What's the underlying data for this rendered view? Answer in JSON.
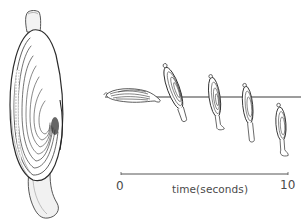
{
  "figure": {
    "sediment_line_color": "#3a3a3a",
    "ink_color": "#2b2b2b",
    "axis": {
      "start_label": "0",
      "end_label": "10",
      "title": "time(seconds)",
      "range": [
        0,
        10
      ]
    },
    "burrowing_stages": [
      {
        "stage": 1,
        "orientation": "horizontal, lying on surface"
      },
      {
        "stage": 2,
        "orientation": "tilted upright, foot entering sediment"
      },
      {
        "stage": 3,
        "orientation": "upright, partially buried"
      },
      {
        "stage": 4,
        "orientation": "upright, mostly buried"
      },
      {
        "stage": 5,
        "orientation": "upright, below surface"
      }
    ]
  }
}
